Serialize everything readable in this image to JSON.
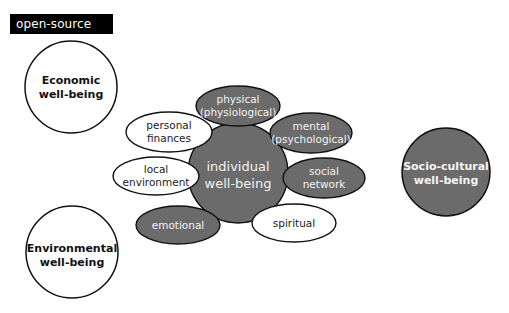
{
  "label": {
    "text": "open-source",
    "bg": "#000000",
    "fg": "#ffffff"
  },
  "colors": {
    "dark_fill": "#6b6b6b",
    "light_fill": "#ffffff",
    "stroke": "#111111"
  },
  "outer_circles": {
    "economic": {
      "line1": "Economic",
      "line2": "well-being",
      "style": "light"
    },
    "environmental": {
      "line1": "Environmental",
      "line2": "well-being",
      "style": "light"
    },
    "socio_cultural": {
      "line1": "Socio-cultural",
      "line2": "well-being",
      "style": "dark"
    }
  },
  "center": {
    "line1": "individual",
    "line2": "well-being",
    "style": "dark"
  },
  "satellites": {
    "physical": {
      "line1": "physical",
      "line2": "(physiological)",
      "style": "dark"
    },
    "mental": {
      "line1": "mental",
      "line2": "(psychological)",
      "style": "dark"
    },
    "social": {
      "line1": "social",
      "line2": "network",
      "style": "dark"
    },
    "spiritual": {
      "line1": "spiritual",
      "style": "light"
    },
    "emotional": {
      "line1": "emotional",
      "style": "dark"
    },
    "local": {
      "line1": "local",
      "line2": "environment",
      "style": "light"
    },
    "personal": {
      "line1": "personal",
      "line2": "finances",
      "style": "light"
    }
  }
}
